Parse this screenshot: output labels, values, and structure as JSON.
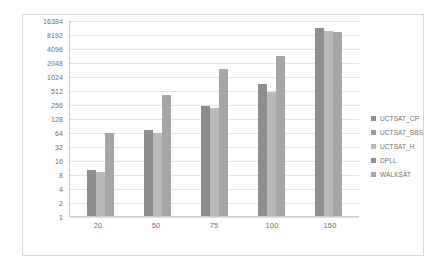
{
  "chart_data": {
    "type": "bar",
    "title": "",
    "subtitle": "",
    "xlabel": "",
    "ylabel": "",
    "categories": [
      "20",
      "50",
      "75",
      "100",
      "150"
    ],
    "yscale": "log2",
    "ylim": [
      1,
      16384
    ],
    "ytick_labels": [
      "16384",
      "8192",
      "4096",
      "2048",
      "1024",
      "512",
      "256",
      "128",
      "64",
      "32",
      "16",
      "8",
      "4",
      "2",
      "1"
    ],
    "ytick_values": [
      16384,
      8192,
      4096,
      2048,
      1024,
      512,
      256,
      128,
      64,
      32,
      16,
      8,
      4,
      2,
      1
    ],
    "grid": true,
    "legend_position": "right",
    "series": [
      {
        "name": "UCTSAT_CP",
        "color": "#8d8d8d",
        "values": [
          10,
          70,
          230,
          700,
          11000
        ]
      },
      {
        "name": "UCTSAT_SBS",
        "color": "#9b9b9b",
        "values": [
          0,
          0,
          0,
          0,
          0
        ]
      },
      {
        "name": "UCTSAT_H",
        "color": "#b9b9b9",
        "values": [
          9,
          62,
          215,
          470,
          9500
        ]
      },
      {
        "name": "DPLL",
        "color": "#8f8f8f",
        "values": [
          0,
          0,
          0,
          0,
          0
        ]
      },
      {
        "name": "WALKSAT",
        "color": "#a6a6a6",
        "values": [
          60,
          400,
          1450,
          2700,
          9000
        ]
      }
    ]
  },
  "legend": {
    "items": [
      {
        "label": "UCTSAT_CP"
      },
      {
        "label": "UCTSAT_SBS"
      },
      {
        "label": "UCTSAT_H"
      },
      {
        "label": "DPLL"
      },
      {
        "label": "WALKSAT"
      }
    ]
  }
}
